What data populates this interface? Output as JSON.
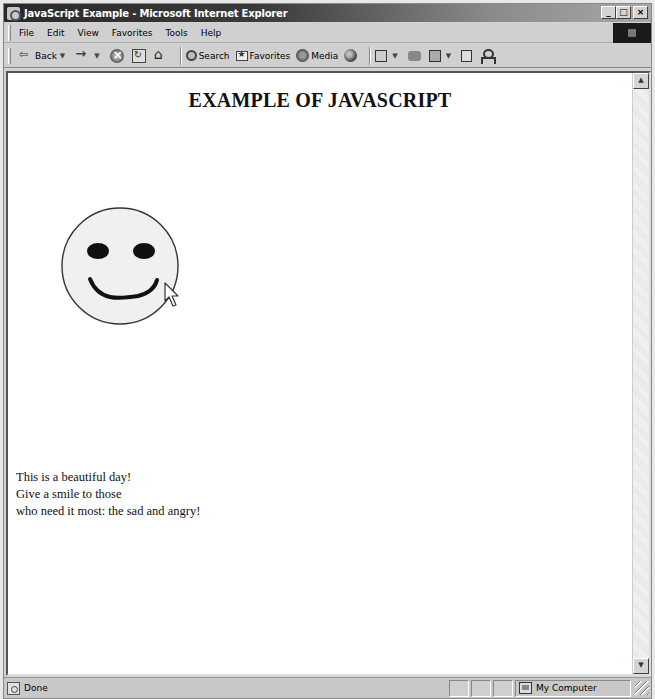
{
  "window": {
    "title": "JavaScript Example - Microsoft Internet Explorer",
    "controls": {
      "minimize": "_",
      "maximize": "□",
      "close": "×"
    }
  },
  "menubar": {
    "items": [
      "File",
      "Edit",
      "View",
      "Favorites",
      "Tools",
      "Help"
    ]
  },
  "toolbar": {
    "back_label": "Back",
    "search_label": "Search",
    "favorites_label": "Favorites",
    "media_label": "Media",
    "icons": [
      "back-icon",
      "forward-icon",
      "stop-icon",
      "refresh-icon",
      "home-icon",
      "search-icon",
      "favorites-icon",
      "media-icon",
      "history-icon",
      "mail-icon",
      "print-icon",
      "edit-icon",
      "discuss-icon",
      "messenger-icon"
    ]
  },
  "page": {
    "heading": "EXAMPLE OF JAVASCRIPT",
    "smiley": {
      "face_color": "#f0f0f0",
      "outline_color": "#333333",
      "feature_color": "#111111"
    },
    "poem": [
      "This is a beautiful day!",
      "Give a smile to those",
      "who need it most: the sad and angry!"
    ]
  },
  "statusbar": {
    "status": "Done",
    "zone": "My Computer"
  }
}
